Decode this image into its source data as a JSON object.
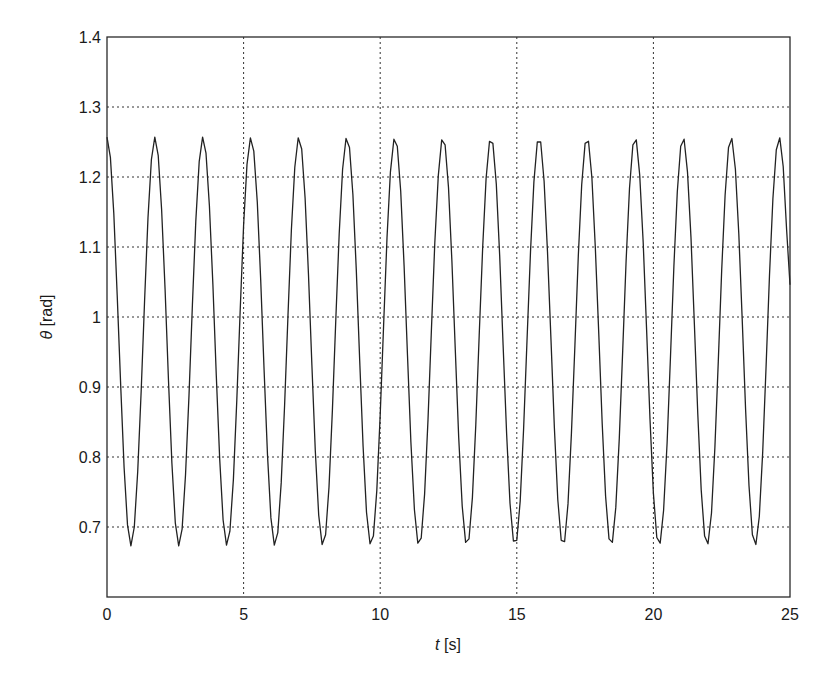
{
  "chart_data": {
    "type": "line",
    "title": "",
    "xlabel_var": "t",
    "xlabel_unit": " [s]",
    "ylabel_var": "θ",
    "ylabel_unit": " [rad]",
    "xlim": [
      0,
      25
    ],
    "ylim": [
      0.6,
      1.4
    ],
    "xticks": [
      0,
      5,
      10,
      15,
      20,
      25
    ],
    "xtick_labels": [
      "0",
      "5",
      "10",
      "15",
      "20",
      "25"
    ],
    "yticks": [
      0.7,
      0.8,
      0.9,
      1.0,
      1.1,
      1.2,
      1.3,
      1.4
    ],
    "ytick_labels": [
      "0.7",
      "0.8",
      "0.9",
      "1",
      "1.1",
      "1.2",
      "1.3",
      "1.4"
    ],
    "grid": true,
    "legend": "none",
    "series": [
      {
        "name": "theta",
        "color": "#222222",
        "x_start": 0,
        "x_step": 0.125,
        "values": [
          1.257,
          1.228,
          1.148,
          1.031,
          0.902,
          0.785,
          0.703,
          0.673,
          0.7,
          0.779,
          0.895,
          1.024,
          1.142,
          1.225,
          1.257,
          1.231,
          1.154,
          1.039,
          0.909,
          0.791,
          0.706,
          0.673,
          0.697,
          0.774,
          0.888,
          1.017,
          1.137,
          1.222,
          1.257,
          1.234,
          1.159,
          1.046,
          0.916,
          0.797,
          0.71,
          0.674,
          0.694,
          0.768,
          0.881,
          1.01,
          1.131,
          1.218,
          1.256,
          1.237,
          1.164,
          1.053,
          0.924,
          0.803,
          0.713,
          0.674,
          0.692,
          0.763,
          0.874,
          1.003,
          1.125,
          1.214,
          1.256,
          1.24,
          1.17,
          1.06,
          0.931,
          0.809,
          0.717,
          0.675,
          0.689,
          0.757,
          0.867,
          0.996,
          1.119,
          1.211,
          1.255,
          1.242,
          1.175,
          1.067,
          0.938,
          0.815,
          0.721,
          0.676,
          0.687,
          0.752,
          0.86,
          0.988,
          1.113,
          1.207,
          1.254,
          1.244,
          1.18,
          1.073,
          0.945,
          0.821,
          0.725,
          0.677,
          0.684,
          0.747,
          0.853,
          0.981,
          1.106,
          1.202,
          1.253,
          1.246,
          1.185,
          1.08,
          0.953,
          0.828,
          0.73,
          0.678,
          0.683,
          0.742,
          0.846,
          0.974,
          1.1,
          1.198,
          1.251,
          1.248,
          1.19,
          1.087,
          0.96,
          0.834,
          0.734,
          0.68,
          0.681,
          0.737,
          0.84,
          0.966,
          1.093,
          1.193,
          1.25,
          1.25,
          1.194,
          1.093,
          0.967,
          0.841,
          0.739,
          0.681,
          0.679,
          0.733,
          0.833,
          0.959,
          1.087,
          1.189,
          1.248,
          1.251,
          1.199,
          1.1,
          0.975,
          0.848,
          0.744,
          0.683,
          0.678,
          0.728,
          0.827,
          0.952,
          1.08,
          1.184,
          1.246,
          1.253,
          1.203,
          1.106,
          0.982,
          0.854,
          0.748,
          0.685,
          0.677,
          0.724,
          0.82,
          0.944,
          1.073,
          1.179,
          1.244,
          1.254,
          1.207,
          1.113,
          0.989,
          0.861,
          0.753,
          0.687,
          0.676,
          0.72,
          0.814,
          0.937,
          1.067,
          1.174,
          1.242,
          1.255,
          1.211,
          1.119,
          0.997,
          0.868,
          0.759,
          0.689,
          0.675,
          0.715,
          0.807,
          0.93,
          1.06,
          1.169,
          1.239,
          1.256,
          1.215,
          1.125,
          1.046
        ]
      }
    ]
  }
}
